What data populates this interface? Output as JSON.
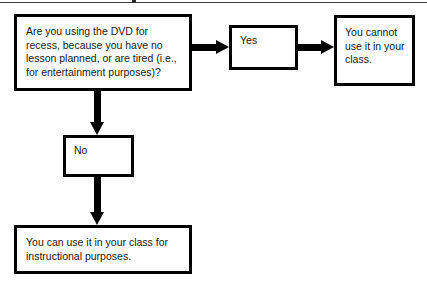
{
  "diagram": {
    "type": "flowchart",
    "background_color": "#ffffff",
    "line_color": "#000000",
    "text_color": "#1a1a1a",
    "top_rule": {
      "name": "top-edge-rule",
      "color": "#3a3a3a"
    },
    "nodes": [
      {
        "id": "question",
        "role": "decision",
        "text": "Are you using the DVD for recess, because you have no lesson planned, or are tired (i.e., for entertainment purposes)?"
      },
      {
        "id": "yes",
        "role": "branch-label",
        "text": "Yes"
      },
      {
        "id": "cannot_use",
        "role": "outcome",
        "text": "You cannot use it in your class."
      },
      {
        "id": "no",
        "role": "branch-label",
        "text": "No"
      },
      {
        "id": "can_use",
        "role": "outcome",
        "text": "You can use it in your class for instructional purposes."
      }
    ],
    "edges": [
      {
        "id": "question_to_yes",
        "from": "question",
        "to": "yes",
        "direction": "right"
      },
      {
        "id": "yes_to_cannot",
        "from": "yes",
        "to": "cannot_use",
        "direction": "right"
      },
      {
        "id": "question_to_no",
        "from": "question",
        "to": "no",
        "direction": "down"
      },
      {
        "id": "no_to_can_use",
        "from": "no",
        "to": "can_use",
        "direction": "down"
      }
    ]
  }
}
